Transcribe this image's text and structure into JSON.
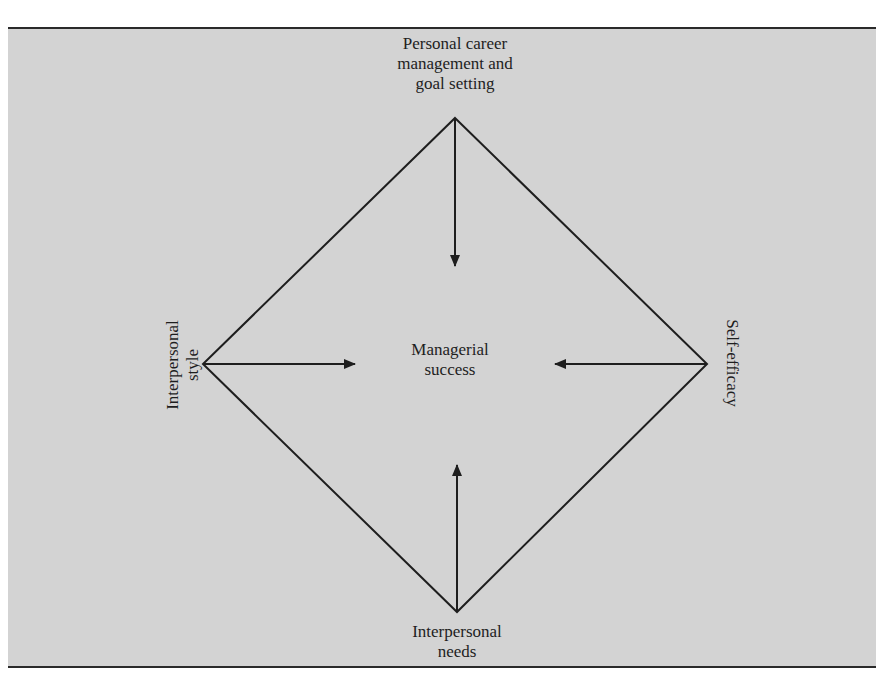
{
  "diagram": {
    "type": "factor-convergence diamond",
    "background_color": "#d3d3d3",
    "line_color": "#1e1e1e",
    "center": {
      "label": "Managerial\nsuccess"
    },
    "nodes": [
      {
        "id": "top",
        "label": "Personal career\nmanagement and\ngoal setting"
      },
      {
        "id": "left",
        "label": "Interpersonal\nstyle"
      },
      {
        "id": "right",
        "label": "Self-efficacy"
      },
      {
        "id": "bottom",
        "label": "Interpersonal\nneeds"
      }
    ],
    "edges": [
      {
        "from": "top",
        "to": "center",
        "arrow": true
      },
      {
        "from": "left",
        "to": "center",
        "arrow": true
      },
      {
        "from": "right",
        "to": "center",
        "arrow": true
      },
      {
        "from": "bottom",
        "to": "center",
        "arrow": true
      }
    ]
  }
}
